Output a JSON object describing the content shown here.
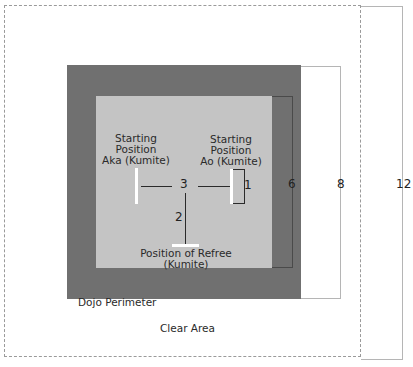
{
  "diagram": {
    "areas": {
      "clear_area_label": "Clear Area",
      "dojo_perimeter_label": "Dojo Perimeter"
    },
    "positions": {
      "aka": {
        "line1": "Starting",
        "line2": "Position",
        "line3": "Aka (Kumite)"
      },
      "ao": {
        "line1": "Starting",
        "line2": "Position",
        "line3": "Ao (Kumite)"
      },
      "referee": {
        "line1": "Position of Refree",
        "line2": "(Kumite)"
      }
    },
    "distances": {
      "ao_to_ao_bracket": "1",
      "center_to_referee": "2",
      "aka_to_ao_center": "3"
    },
    "dimensions": {
      "competition_area": "6",
      "dojo_perimeter": "8",
      "clear_area": "12"
    },
    "colors": {
      "perimeter": "#707070",
      "competition_area": "#c4c4c4",
      "markers": "#ffffff",
      "lines": "#2a2a2a",
      "clear_area_border": "#9a9a9a"
    }
  }
}
